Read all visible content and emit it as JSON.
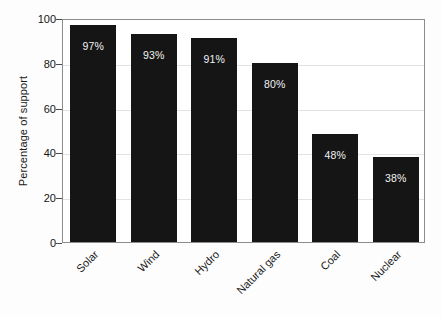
{
  "chart_data": {
    "type": "bar",
    "title": "",
    "subtitle": "",
    "xlabel": "",
    "ylabel": "Percentage of support",
    "categories": [
      "Solar",
      "Wind",
      "Hydro",
      "Natural gas",
      "Coal",
      "Nuclear"
    ],
    "values": [
      97,
      93,
      91,
      80,
      48,
      38
    ],
    "data_labels": [
      "97%",
      "93%",
      "91%",
      "80%",
      "48%",
      "38%"
    ],
    "ylim": [
      0,
      100
    ],
    "yticks": [
      0,
      20,
      40,
      60,
      80,
      100
    ],
    "ytick_labels": [
      "0",
      "20",
      "40",
      "60",
      "80",
      "100"
    ],
    "grid": true,
    "grid_axis": "y",
    "legend": false,
    "legend_position": "none",
    "xtick_rotation": -45,
    "bar_color": "#151515",
    "data_label_color": "#f2f2f2",
    "grid_color": "#e3e3e3",
    "frame_color": "#8c8c8c",
    "background_color": "#ffffff"
  }
}
